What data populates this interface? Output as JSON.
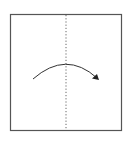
{
  "diagram": {
    "type": "origami-fold-step",
    "paper": {
      "x": 10.5,
      "y": 14.5,
      "width": 111,
      "height": 116,
      "stroke": "#555555",
      "fill": "#ffffff"
    },
    "fold_line": {
      "style": "valley-dotted",
      "x": 66,
      "y1": 15,
      "y2": 130,
      "stroke": "#666666"
    },
    "arrow": {
      "direction": "left-to-right",
      "start": [
        33,
        79
      ],
      "peak": [
        66,
        64
      ],
      "end": [
        98,
        79
      ],
      "stroke": "#333333"
    }
  }
}
